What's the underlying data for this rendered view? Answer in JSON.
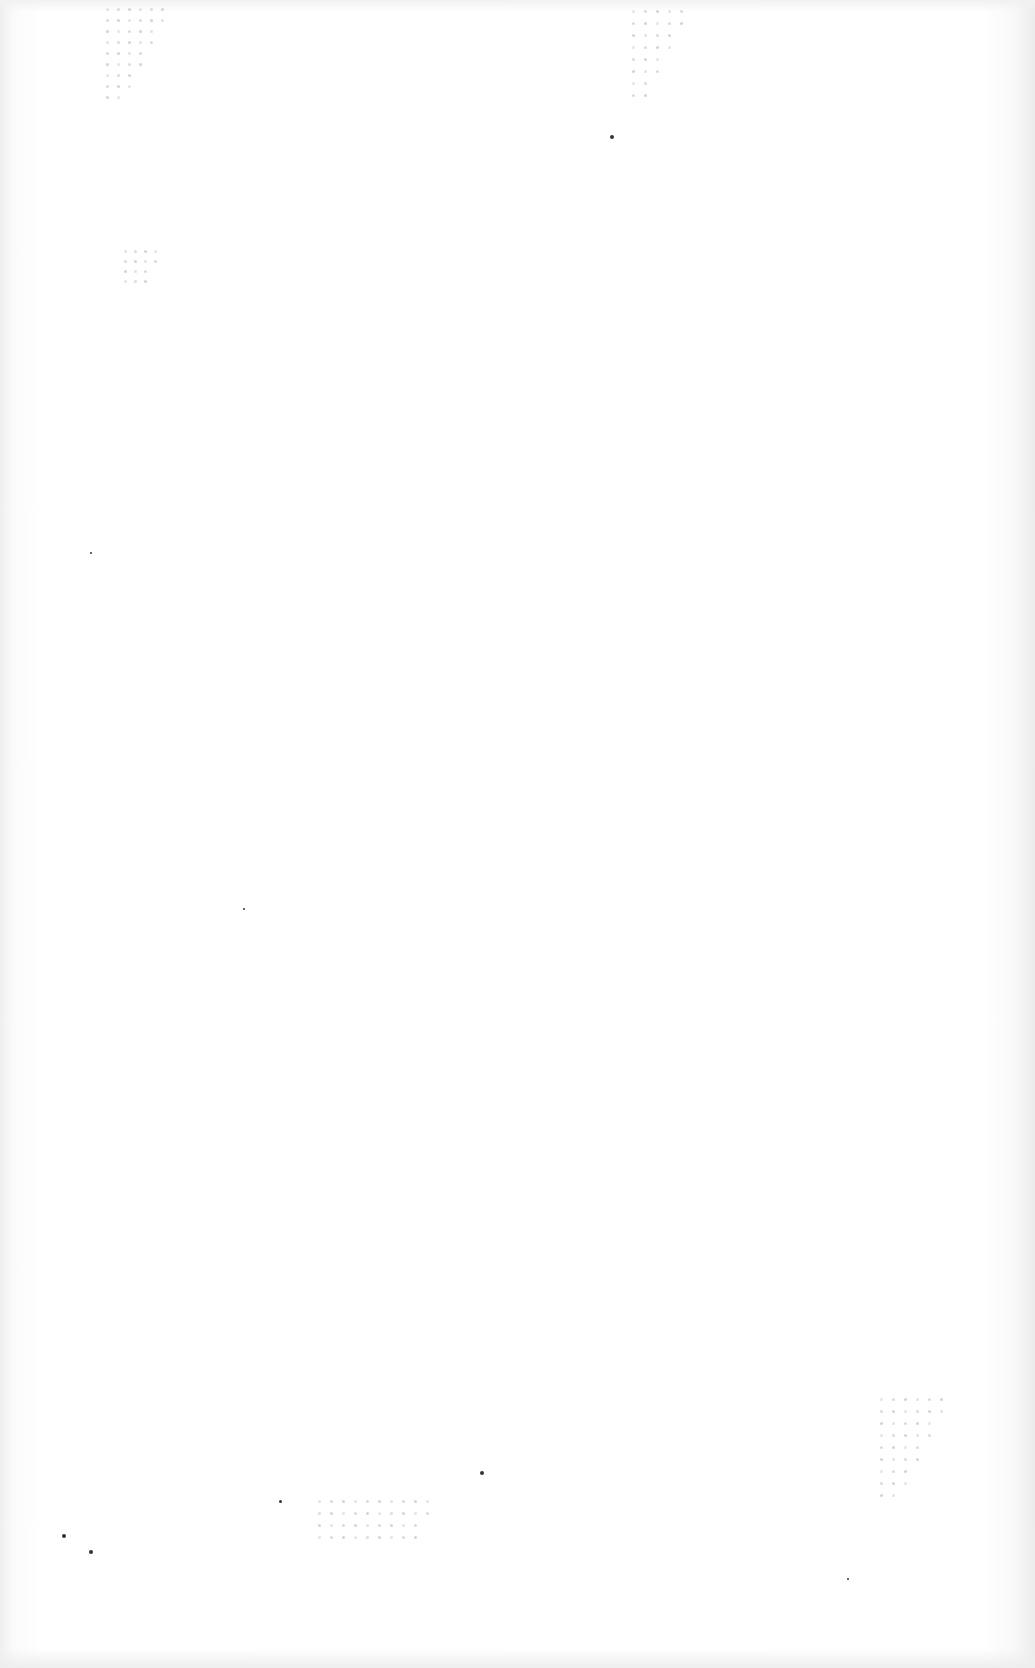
{
  "document": {
    "type": "blank scanned page",
    "text": "",
    "dot_clusters": [
      {
        "name": "top-left-dots",
        "x": 106,
        "y": 8,
        "cols": 6,
        "rows": 9,
        "gap": 11
      },
      {
        "name": "top-center-dots",
        "x": 632,
        "y": 10,
        "cols": 5,
        "rows": 8,
        "gap": 12
      },
      {
        "name": "left-small-dots",
        "x": 124,
        "y": 250,
        "cols": 4,
        "rows": 4,
        "gap": 10
      },
      {
        "name": "bottom-right-dots",
        "x": 880,
        "y": 1398,
        "cols": 6,
        "rows": 9,
        "gap": 12
      },
      {
        "name": "bottom-center-dots",
        "x": 318,
        "y": 1500,
        "cols": 10,
        "rows": 4,
        "gap": 12
      }
    ],
    "specks": [
      {
        "x": 610,
        "y": 135,
        "r": 2
      },
      {
        "x": 90,
        "y": 552,
        "r": 1
      },
      {
        "x": 243,
        "y": 908,
        "r": 1
      },
      {
        "x": 480,
        "y": 1471,
        "r": 2
      },
      {
        "x": 279,
        "y": 1500,
        "r": 1.5
      },
      {
        "x": 89,
        "y": 1550,
        "r": 2
      },
      {
        "x": 62,
        "y": 1534,
        "r": 2
      },
      {
        "x": 847,
        "y": 1578,
        "r": 1
      }
    ]
  }
}
